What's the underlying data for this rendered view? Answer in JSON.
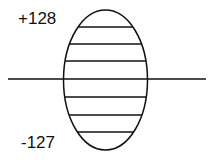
{
  "diagram": {
    "labels": {
      "top": "+128",
      "bottom": "-127"
    },
    "shape": "ellipse",
    "hatch_lines": 6,
    "axis": "horizontal",
    "colors": {
      "stroke": "#111111",
      "background": "#ffffff"
    }
  }
}
